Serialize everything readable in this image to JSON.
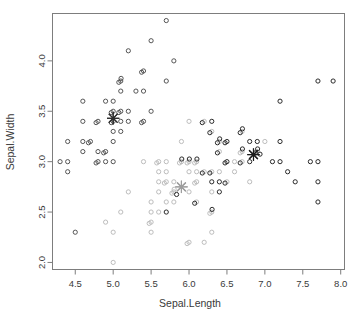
{
  "chart_data": {
    "type": "scatter",
    "title": "",
    "xlabel": "Sepal.Length",
    "ylabel": "Sepal.Width",
    "xlim": [
      4.2,
      8.05
    ],
    "ylim": [
      1.93,
      4.47
    ],
    "xticks": [
      "4.5",
      "5.0",
      "5.5",
      "6.0",
      "6.5",
      "7.0",
      "7.5",
      "8.0"
    ],
    "xtick_values": [
      4.5,
      5.0,
      5.5,
      6.0,
      6.5,
      7.0,
      7.5,
      8.0
    ],
    "yticks": [
      "2.0",
      "2.5",
      "3.0",
      "3.5",
      "4.0"
    ],
    "ytick_values": [
      2.0,
      2.5,
      3.0,
      3.5,
      4.0
    ],
    "grid": false,
    "legend": "none",
    "marker": "open-circle",
    "marker_radius": 2.1,
    "series": [
      {
        "name": "cluster-1",
        "color": "#555555",
        "x": [
          5.1,
          4.9,
          4.7,
          4.6,
          5.0,
          5.4,
          4.6,
          5.0,
          4.4,
          4.9,
          5.4,
          4.8,
          4.8,
          4.3,
          5.8,
          5.7,
          5.4,
          5.1,
          5.7,
          5.1,
          5.4,
          5.1,
          4.6,
          5.1,
          4.8,
          5.0,
          5.0,
          5.2,
          5.2,
          4.7,
          4.8,
          5.4,
          5.2,
          5.5,
          4.9,
          5.0,
          5.5,
          4.9,
          4.4,
          5.1,
          5.0,
          4.5,
          4.4,
          5.0,
          5.1,
          4.8,
          5.1,
          4.6,
          5.3,
          5.0
        ],
        "y": [
          3.5,
          3.0,
          3.2,
          3.1,
          3.6,
          3.9,
          3.4,
          3.4,
          2.9,
          3.1,
          3.7,
          3.4,
          3.0,
          3.0,
          4.0,
          4.4,
          3.9,
          3.5,
          3.8,
          3.8,
          3.4,
          3.7,
          3.6,
          3.3,
          3.4,
          3.0,
          3.4,
          3.5,
          3.4,
          3.2,
          3.1,
          3.4,
          4.1,
          4.2,
          3.1,
          3.2,
          3.5,
          3.6,
          3.0,
          3.4,
          3.5,
          2.3,
          3.2,
          3.5,
          3.8,
          3.0,
          3.8,
          3.2,
          3.7,
          3.3
        ]
      },
      {
        "name": "cluster-2",
        "color": "#bdbdbd",
        "x": [
          7.0,
          6.4,
          6.9,
          5.5,
          6.5,
          5.7,
          6.3,
          4.9,
          6.6,
          5.2,
          5.0,
          5.9,
          6.0,
          6.1,
          5.6,
          6.7,
          5.6,
          5.8,
          6.2,
          5.6,
          5.9,
          6.1,
          6.3,
          6.1,
          6.4,
          6.6,
          6.8,
          6.7,
          6.0,
          5.7,
          5.5,
          5.5,
          5.8,
          6.0,
          5.4,
          6.0,
          6.7,
          6.3,
          5.6,
          5.5,
          5.5,
          6.1,
          5.8,
          5.0,
          5.6,
          5.7,
          5.7,
          6.2,
          5.1,
          5.7,
          5.8,
          6.0,
          6.3,
          5.8,
          6.1,
          6.3,
          6.1,
          6.4,
          6.0,
          5.6,
          6.0,
          6.7,
          6.3,
          6.2,
          5.9
        ],
        "y": [
          3.2,
          3.2,
          3.1,
          2.3,
          2.8,
          2.8,
          3.3,
          2.4,
          2.9,
          2.7,
          2.0,
          3.0,
          2.2,
          2.9,
          2.9,
          3.1,
          3.0,
          2.7,
          2.2,
          2.5,
          3.2,
          2.8,
          2.5,
          2.8,
          2.9,
          3.0,
          2.8,
          3.0,
          2.9,
          2.6,
          2.4,
          2.4,
          2.7,
          2.7,
          3.0,
          3.4,
          3.1,
          2.3,
          3.0,
          2.5,
          2.6,
          3.0,
          2.6,
          2.3,
          2.7,
          3.0,
          2.9,
          2.9,
          2.5,
          2.8,
          2.7,
          3.0,
          2.9,
          2.8,
          3.0,
          2.5,
          2.6,
          3.1,
          3.0,
          2.8,
          2.2,
          3.3,
          2.7,
          3.4,
          3.0
        ]
      },
      {
        "name": "cluster-3",
        "color": "#2b2b2b",
        "x": [
          6.3,
          7.1,
          7.6,
          7.3,
          7.2,
          6.5,
          6.4,
          6.8,
          5.7,
          7.7,
          7.7,
          6.9,
          7.7,
          7.2,
          7.2,
          7.4,
          7.9,
          6.4,
          6.3,
          6.1,
          7.7,
          6.3,
          6.4,
          6.0,
          6.9,
          6.7,
          6.9,
          5.8,
          6.8,
          6.7,
          6.7,
          6.3,
          6.5,
          6.2,
          5.9,
          6.4,
          6.5,
          6.5,
          6.7,
          6.9,
          6.3,
          6.5,
          6.2,
          6.1,
          6.4
        ],
        "y": [
          3.3,
          3.0,
          3.0,
          2.9,
          3.6,
          3.2,
          2.7,
          3.0,
          2.5,
          3.8,
          2.6,
          3.2,
          2.8,
          3.0,
          3.2,
          2.8,
          3.8,
          2.8,
          2.8,
          2.6,
          3.0,
          3.4,
          3.1,
          3.0,
          3.1,
          3.1,
          3.1,
          2.7,
          3.2,
          3.3,
          3.0,
          2.5,
          3.0,
          3.4,
          3.0,
          3.2,
          3.0,
          2.8,
          3.3,
          3.1,
          2.9,
          3.2,
          2.9,
          3.0,
          3.2
        ]
      }
    ],
    "centers": [
      {
        "name": "center-cluster-1",
        "x": 5.0,
        "y": 3.43,
        "color": "#2e2e2e",
        "marker": "asterisk"
      },
      {
        "name": "center-cluster-2",
        "x": 5.9,
        "y": 2.75,
        "color": "#9e9e9e",
        "marker": "asterisk"
      },
      {
        "name": "center-cluster-3",
        "x": 6.85,
        "y": 3.07,
        "color": "#1a1a1a",
        "marker": "asterisk"
      }
    ]
  },
  "colors": {
    "frame": "#7d7d7d",
    "text": "#3a3a3a",
    "background": "#ffffff",
    "top_rule": "#b9b9b9"
  }
}
